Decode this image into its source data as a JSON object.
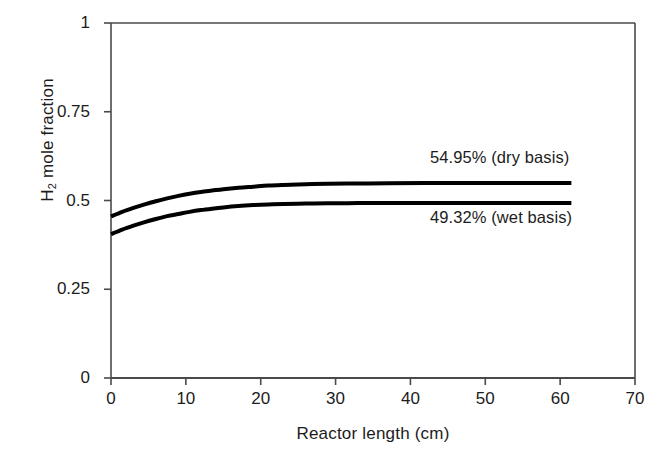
{
  "chart_data": {
    "type": "line",
    "title": "",
    "xlabel": "Reactor length (cm)",
    "ylabel": "H2 mole fraction",
    "ylabel_base": "H",
    "ylabel_sub": "2",
    "ylabel_rest": " mole fraction",
    "xlim": [
      0,
      70
    ],
    "ylim": [
      0,
      1
    ],
    "xticks": [
      0,
      10,
      20,
      30,
      40,
      50,
      60,
      70
    ],
    "xtick_labels": [
      "0",
      "10",
      "20",
      "30",
      "40",
      "50",
      "60",
      "70"
    ],
    "yticks": [
      0,
      0.25,
      0.5,
      0.75,
      1
    ],
    "ytick_labels": [
      "0",
      "0.25",
      "0.5",
      "0.75",
      "1"
    ],
    "grid": false,
    "legend": "none",
    "line_color": "#000000",
    "line_width": 4,
    "annotations": [
      {
        "name": "dry-basis-label",
        "text": "54.95% (dry basis)",
        "x": 43,
        "y": 0.62,
        "series": "dry basis"
      },
      {
        "name": "wet-basis-label",
        "text": "49.32% (wet basis)",
        "x": 43,
        "y": 0.45,
        "series": "wet basis"
      }
    ],
    "series": [
      {
        "name": "dry basis",
        "plateau_value": 0.5495,
        "plateau_label": "54.95%",
        "start_value": 0.455,
        "x_end": 61.5,
        "x": [
          0,
          1.5,
          3,
          4.5,
          6,
          7.5,
          9,
          10.5,
          12,
          13.5,
          15,
          17,
          19,
          21,
          23,
          26,
          29,
          33,
          37,
          42,
          48,
          55,
          61.5
        ],
        "y": [
          0.455,
          0.468,
          0.479,
          0.489,
          0.498,
          0.506,
          0.513,
          0.519,
          0.524,
          0.528,
          0.532,
          0.536,
          0.539,
          0.542,
          0.5438,
          0.5458,
          0.547,
          0.548,
          0.5486,
          0.549,
          0.5493,
          0.5494,
          0.5495
        ]
      },
      {
        "name": "wet basis",
        "plateau_value": 0.4932,
        "plateau_label": "49.32%",
        "start_value": 0.405,
        "x_end": 61.5,
        "x": [
          0,
          1.5,
          3,
          4.5,
          6,
          7.5,
          9,
          10.5,
          12,
          13.5,
          15,
          17,
          19,
          21,
          23,
          26,
          29,
          33,
          37,
          42,
          48,
          55,
          61.5
        ],
        "y": [
          0.405,
          0.418,
          0.429,
          0.439,
          0.448,
          0.456,
          0.462,
          0.468,
          0.473,
          0.477,
          0.4805,
          0.4843,
          0.487,
          0.489,
          0.4903,
          0.4915,
          0.4922,
          0.4927,
          0.4929,
          0.493,
          0.4931,
          0.4932,
          0.4932
        ]
      }
    ]
  }
}
